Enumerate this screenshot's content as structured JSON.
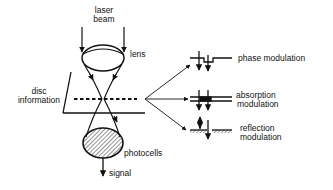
{
  "diagram": {
    "labels": {
      "laser_beam": [
        "laser",
        "beam"
      ],
      "lens": "lens",
      "disc_information": [
        "disc",
        "information"
      ],
      "photocells": "photocells",
      "signal": "signal"
    },
    "modulations": [
      {
        "id": "phase",
        "lines": [
          "phase modulation"
        ]
      },
      {
        "id": "absorption",
        "lines": [
          "absorption",
          "modulation"
        ]
      },
      {
        "id": "reflection",
        "lines": [
          "reflection",
          "modulation"
        ]
      }
    ],
    "colors": {
      "ink": "#111111",
      "background": "#ffffff"
    }
  }
}
